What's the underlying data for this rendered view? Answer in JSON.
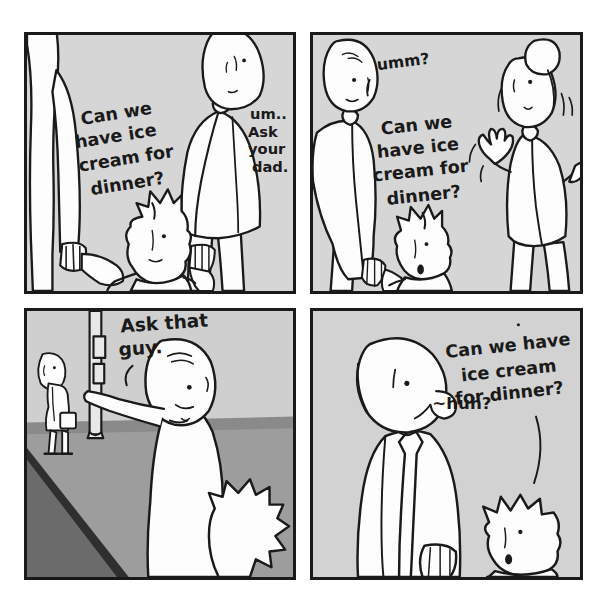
{
  "comic": {
    "title": "Can we have ice cream for dinner?",
    "page_width": 593,
    "page_height": 610,
    "background_color": "#ffffff",
    "panel_fill": "#d6d6d6",
    "ink_color": "#1a1a1a",
    "floor_color": "#9a9a9a",
    "wall_color": "#c2c2c2",
    "shadow_color": "#6e6e6e",
    "panels": [
      {
        "id": "panel-1",
        "number": 1,
        "characters": [
          "mother-partial-left",
          "child",
          "father-tall"
        ],
        "dialogue": [
          {
            "speaker": "child",
            "lines": [
              "Can we",
              "have  ice",
              "cream for",
              "dinner?"
            ],
            "text": "Can we have ice cream for dinner?"
          },
          {
            "speaker": "father-tall",
            "lines": [
              "um..",
              "Ask",
              "your",
              "dad."
            ],
            "text": "um.. Ask your dad."
          }
        ]
      },
      {
        "id": "panel-2",
        "number": 2,
        "characters": [
          "father-tall",
          "child",
          "woman-bun"
        ],
        "dialogue": [
          {
            "speaker": "father-tall",
            "lines": [
              "umm?"
            ],
            "text": "umm?"
          },
          {
            "speaker": "child",
            "lines": [
              "Can we",
              "have ice",
              "cream for",
              "dinner?"
            ],
            "text": "Can we have ice cream for dinner?"
          }
        ]
      },
      {
        "id": "panel-3",
        "number": 3,
        "characters": [
          "man-pointing",
          "child",
          "background-man-briefcase",
          "street-pole"
        ],
        "dialogue": [
          {
            "speaker": "man-pointing",
            "lines": [
              "Ask that",
              "guy."
            ],
            "text": "Ask that guy."
          }
        ]
      },
      {
        "id": "panel-4",
        "number": 4,
        "characters": [
          "bald-man-in-tie",
          "child"
        ],
        "dialogue": [
          {
            "speaker": "bald-man-in-tie",
            "lines": [
              "~huh?"
            ],
            "text": "~huh?"
          },
          {
            "speaker": "child",
            "lines": [
              "Can we have",
              "ice cream",
              "for dinner?"
            ],
            "text": "Can we have ice cream for dinner?"
          }
        ]
      }
    ]
  }
}
